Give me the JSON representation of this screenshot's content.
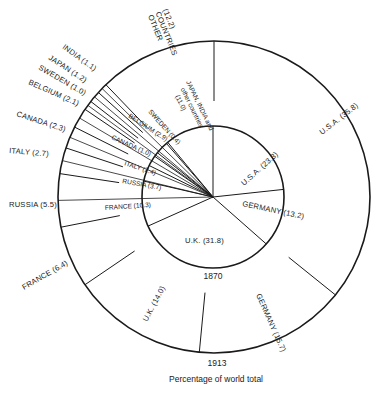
{
  "chart_data": {
    "type": "pie",
    "subtype": "concentric-pie",
    "title": "",
    "caption": "Percentage of world total",
    "series": [
      {
        "name": "1870",
        "ring": "inner",
        "categories": [
          "U.S.A.",
          "GERMANY",
          "U.K.",
          "FRANCE",
          "RUSSIA",
          "ITALY",
          "CANADA",
          "BELGIUM",
          "SWEDEN",
          "JAPAN, INDIA and other countries"
        ],
        "values": [
          23.3,
          13.2,
          31.8,
          10.3,
          3.7,
          2.4,
          1.0,
          2.9,
          0.4,
          11.0
        ]
      },
      {
        "name": "1913",
        "ring": "outer",
        "categories": [
          "U.S.A.",
          "GERMANY",
          "U.K.",
          "FRANCE",
          "RUSSIA",
          "ITALY",
          "CANADA",
          "BELGIUM",
          "SWEDEN",
          "JAPAN",
          "INDIA",
          "OTHER COUNTRIES"
        ],
        "values": [
          35.8,
          15.7,
          14.0,
          6.4,
          5.5,
          2.7,
          2.3,
          2.1,
          1.0,
          1.2,
          1.1,
          12.2
        ]
      }
    ],
    "units": "%",
    "direction": "clockwise from 12 o'clock"
  },
  "labels": {
    "inner_year": "1870",
    "outer_year": "1913",
    "caption": "Percentage of world total"
  },
  "inner_labels": [
    {
      "text": "U.S.A. (23.3)"
    },
    {
      "text": "GERMANY (13.2)"
    },
    {
      "text": "U.K. (31.8)"
    },
    {
      "text": "FRANCE (10.3)"
    },
    {
      "text": "RUSSIA (3.7)"
    },
    {
      "text": "ITALY (2.4)"
    },
    {
      "text": "CANADA (1.0)"
    },
    {
      "text": "BELGIUM (2.9)"
    },
    {
      "text": "SWEDEN (0.4)"
    },
    {
      "line1": "JAPAN, INDIA and",
      "line2": "other countries",
      "line3": "(11.0)"
    }
  ],
  "outer_labels": [
    {
      "text": "U.S.A. (35.8)"
    },
    {
      "text": "GERMANY (15.7)"
    },
    {
      "text": "U.K. (14.0)"
    },
    {
      "text": "FRANCE (6.4)"
    },
    {
      "text": "RUSSIA (5.5)"
    },
    {
      "text": "ITALY (2.7)"
    },
    {
      "text": "CANADA (2.3)"
    },
    {
      "text": "BELGIUM (2.1)"
    },
    {
      "text": "SWEDEN (1.0)"
    },
    {
      "text": "JAPAN (1.2)"
    },
    {
      "text": "INDIA (1.1)"
    },
    {
      "line1": "OTHER",
      "line2": "COUNTRIES",
      "line3": "(12.2)"
    }
  ],
  "colors": {
    "ink": "#1a1a1a",
    "background": "#ffffff"
  }
}
